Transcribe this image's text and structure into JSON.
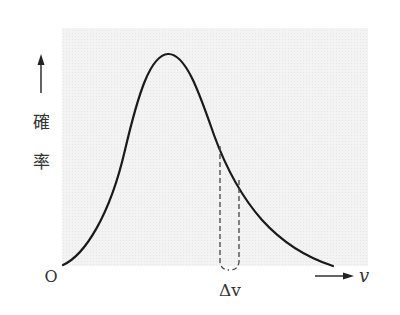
{
  "diagram": {
    "type": "probability-distribution-curve",
    "y_axis": {
      "label_chars": [
        "確",
        "率"
      ],
      "arrow": "up-arrow"
    },
    "x_axis": {
      "origin_label": "O",
      "variable_label": "v",
      "arrow": "right-arrow"
    },
    "interval_label": "Δv",
    "colors": {
      "background_panel": "#f1f1f1",
      "curve": "#1a1a1a",
      "dashed": "#444444",
      "text": "#333333"
    }
  }
}
